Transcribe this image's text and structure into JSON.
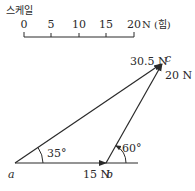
{
  "scale": {
    "title": "스케일",
    "ticks": [
      "0",
      "5",
      "10",
      "15",
      "20"
    ],
    "unit": "N (힘)"
  },
  "vectors": [
    {
      "from": "a",
      "to": "b",
      "magnitude_label": "15 N",
      "angle_label": "35°"
    },
    {
      "from": "b",
      "to": "c",
      "magnitude_label": "20 N",
      "angle_label": "60°"
    },
    {
      "from": "a",
      "to": "c",
      "magnitude_label": "30.5 N"
    }
  ],
  "points": {
    "a": "a",
    "b": "b",
    "c": "c"
  },
  "colors": {
    "line": "#2a2a2a",
    "background": "#ffffff"
  }
}
